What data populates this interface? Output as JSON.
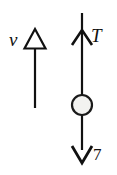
{
  "figure": {
    "background_color": "#ffffff",
    "stroke_color": "#111111",
    "ball_fill_color": "#f2f2f0",
    "labels": {
      "velocity": "v",
      "tension": "T",
      "weight": "7"
    },
    "elements": [
      {
        "name": "velocity-arrow",
        "type": "arrow",
        "direction": "up",
        "head_style": "hollow-triangle",
        "label": "v",
        "x": 35,
        "y_top": 29,
        "y_bottom": 108
      },
      {
        "name": "tension-arrow",
        "type": "arrow",
        "direction": "up",
        "head_style": "open-barb",
        "label": "T",
        "x": 82,
        "y_top": 13,
        "head_y": 31
      },
      {
        "name": "ball",
        "type": "circle",
        "cx": 82,
        "cy": 105,
        "r": 10,
        "fill": "#f2f2f0"
      },
      {
        "name": "weight-arrow",
        "type": "arrow",
        "direction": "down",
        "head_style": "open-barb",
        "label": "7",
        "x": 82,
        "y_bottom": 163
      }
    ]
  }
}
